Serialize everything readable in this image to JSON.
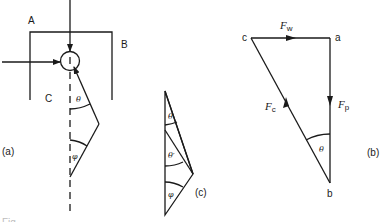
{
  "diagram": {
    "panel_a": {
      "tag": "(a)",
      "labels": {
        "A": "A",
        "B": "B",
        "C": "C"
      },
      "angles": {
        "theta": "θ",
        "phi": "φ"
      }
    },
    "panel_b": {
      "tag": "(b)",
      "vertices": {
        "a": "a",
        "b": "b",
        "c": "c"
      },
      "forces": {
        "Fw": {
          "main": "F",
          "sub": "w"
        },
        "Fp": {
          "main": "F",
          "sub": "p"
        },
        "Fc": {
          "main": "F",
          "sub": "c"
        }
      },
      "angle": "θ"
    },
    "panel_c": {
      "tag": "(c)",
      "angles": {
        "theta": "θ",
        "theta_prime": "θ′",
        "phi": "φ"
      }
    },
    "caption_fragment": "Fig."
  },
  "colors": {
    "ink": "#1a1a1a",
    "background": "#ffffff"
  }
}
